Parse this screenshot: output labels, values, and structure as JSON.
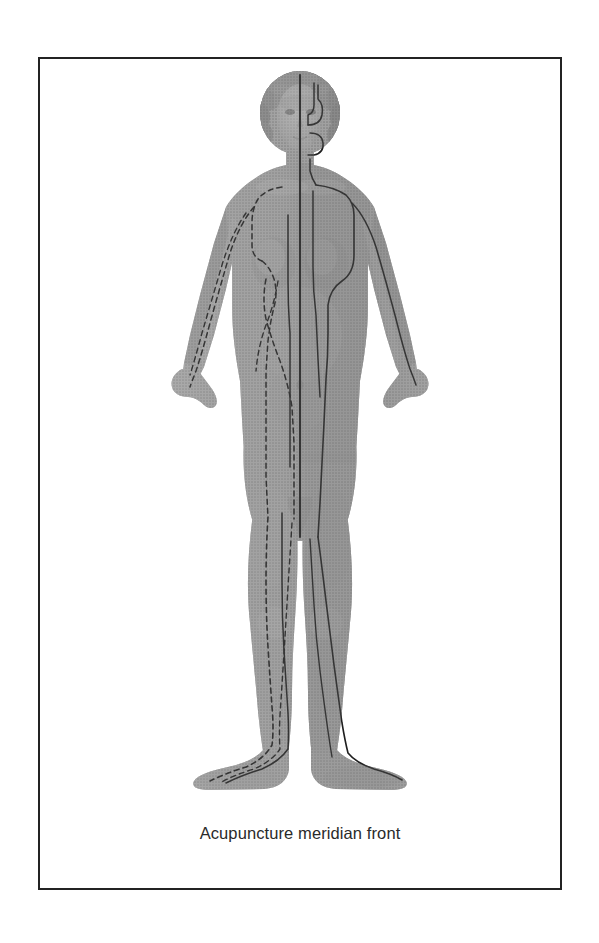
{
  "plate": {
    "caption": "Acupuncture meridian front",
    "border_color": "#232323",
    "background_color": "#ffffff"
  },
  "figure": {
    "title": "Acupuncture meridian front",
    "view": "front",
    "rendering": "grayscale halftone engraving",
    "skin_tone_mid": "#9a9a9a",
    "skin_tone_shadow": "#6f6f6f",
    "skin_tone_light": "#bdbdbd",
    "meridian_line_color": "#1f1f1f",
    "parts": [
      "head-hair",
      "face",
      "neck",
      "torso",
      "left-arm",
      "right-arm",
      "left-hand",
      "right-hand",
      "pelvis",
      "left-leg",
      "right-leg",
      "left-foot",
      "right-foot"
    ],
    "meridian_lines": [
      {
        "name": "conception-vessel-midline",
        "style": "solid",
        "side": "center"
      },
      {
        "name": "head-branch-solid",
        "style": "solid",
        "side": "right"
      },
      {
        "name": "stomach-meridian-solid",
        "style": "solid",
        "side": "right"
      },
      {
        "name": "kidney-meridian-solid",
        "style": "solid",
        "side": "right"
      },
      {
        "name": "arm-meridian-solid",
        "style": "solid",
        "side": "right"
      },
      {
        "name": "leg-meridian-solid",
        "style": "solid",
        "side": "right"
      },
      {
        "name": "arm-meridian-dashed",
        "style": "dashed",
        "side": "left"
      },
      {
        "name": "shoulder-loop-dashed",
        "style": "dashed",
        "side": "left"
      },
      {
        "name": "spleen-meridian-dashed",
        "style": "dashed",
        "side": "left"
      },
      {
        "name": "liver-meridian-dashed",
        "style": "dashed",
        "side": "left"
      },
      {
        "name": "leg-meridian-dashed",
        "style": "dashed",
        "side": "left"
      },
      {
        "name": "chest-crossing-dashed",
        "style": "dashed",
        "side": "left"
      }
    ]
  }
}
